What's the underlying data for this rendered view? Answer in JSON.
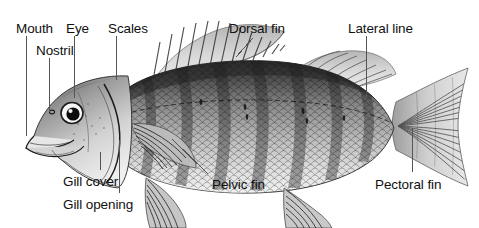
{
  "figure": {
    "style": "black and white engraving",
    "background_color": "#ffffff",
    "ink_color": "#101010",
    "leader_color": "#555555"
  },
  "labels": [
    {
      "id": "mouth",
      "text": "Mouth",
      "x": 16,
      "y": 22
    },
    {
      "id": "eye",
      "text": "Eye",
      "x": 66,
      "y": 22
    },
    {
      "id": "scales",
      "text": "Scales",
      "x": 108,
      "y": 22
    },
    {
      "id": "dorsal-fin",
      "text": "Dorsal fin",
      "x": 229,
      "y": 22
    },
    {
      "id": "lateral-line",
      "text": "Lateral line",
      "x": 348,
      "y": 22
    },
    {
      "id": "nostril",
      "text": "Nostril",
      "x": 36,
      "y": 44
    },
    {
      "id": "gill-cover",
      "text": "Gill cover",
      "x": 63,
      "y": 175
    },
    {
      "id": "gill-opening",
      "text": "Gill opening",
      "x": 63,
      "y": 198
    },
    {
      "id": "pelvic-fin",
      "text": "Pelvic fin",
      "x": 212,
      "y": 178
    },
    {
      "id": "pectoral-fin",
      "text": "Pectoral fin",
      "x": 375,
      "y": 178
    }
  ],
  "leaders": [
    {
      "id": "mouth-leader",
      "x1": 26,
      "y1": 36,
      "x2": 26,
      "y2": 136
    },
    {
      "id": "eye-leader",
      "x1": 74,
      "y1": 36,
      "x2": 74,
      "y2": 98
    },
    {
      "id": "scales-leader",
      "x1": 116,
      "y1": 36,
      "x2": 116,
      "y2": 80
    },
    {
      "id": "nostril-leader",
      "x1": 49,
      "y1": 58,
      "x2": 49,
      "y2": 112
    },
    {
      "id": "dorsal-fin-leader",
      "x1": 253,
      "y1": 38,
      "x2": 236,
      "y2": 57
    },
    {
      "id": "lateral-line-leader",
      "x1": 366,
      "y1": 36,
      "x2": 366,
      "y2": 104
    },
    {
      "id": "gill-cover-leader",
      "x1": 100,
      "y1": 152,
      "x2": 100,
      "y2": 170
    },
    {
      "id": "gill-opening-leader",
      "x1": 119,
      "y1": 140,
      "x2": 119,
      "y2": 193
    },
    {
      "id": "pelvic-fin-leader",
      "x1": 208,
      "y1": 174,
      "x2": 172,
      "y2": 139
    },
    {
      "id": "pectoral-fin-leader",
      "x1": 412,
      "y1": 172,
      "x2": 412,
      "y2": 128
    }
  ],
  "illustration": {
    "dorsal_spine_count": 13,
    "lateral_bar_count": 7,
    "fins": [
      "spiny-dorsal-fin",
      "soft-dorsal-fin",
      "caudal-fin",
      "anal-fin",
      "pelvic-fin",
      "pectoral-fin"
    ]
  }
}
